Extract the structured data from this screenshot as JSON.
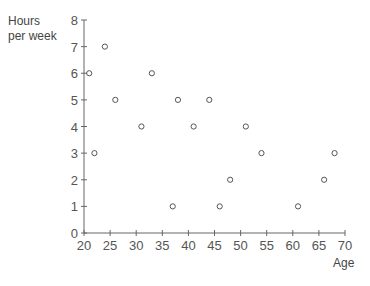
{
  "chart_data": {
    "type": "scatter",
    "title": "",
    "xlabel": "Age",
    "ylabel_lines": [
      "Hours",
      "per week"
    ],
    "xlim": [
      20,
      70
    ],
    "ylim": [
      0,
      8
    ],
    "xticks": [
      20,
      25,
      30,
      35,
      40,
      45,
      50,
      55,
      60,
      65,
      70
    ],
    "yticks": [
      0,
      1,
      2,
      3,
      4,
      5,
      6,
      7,
      8
    ],
    "grid": false,
    "legend": null,
    "marker": "open-circle",
    "points": [
      {
        "x": 21,
        "y": 6
      },
      {
        "x": 22,
        "y": 3
      },
      {
        "x": 24,
        "y": 7
      },
      {
        "x": 26,
        "y": 5
      },
      {
        "x": 31,
        "y": 4
      },
      {
        "x": 33,
        "y": 6
      },
      {
        "x": 37,
        "y": 1
      },
      {
        "x": 38,
        "y": 5
      },
      {
        "x": 41,
        "y": 4
      },
      {
        "x": 44,
        "y": 5
      },
      {
        "x": 46,
        "y": 1
      },
      {
        "x": 48,
        "y": 2
      },
      {
        "x": 51,
        "y": 4
      },
      {
        "x": 54,
        "y": 3
      },
      {
        "x": 61,
        "y": 1
      },
      {
        "x": 66,
        "y": 2
      },
      {
        "x": 68,
        "y": 3
      }
    ]
  },
  "labels": {
    "y_line1": "Hours",
    "y_line2": "per week",
    "x": "Age"
  },
  "colors": {
    "axis": "#666666",
    "marker": "#555555",
    "text": "#555555"
  }
}
